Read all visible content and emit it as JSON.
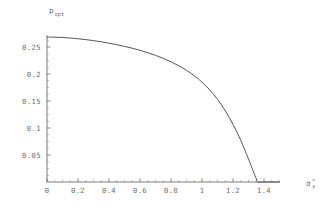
{
  "chart_data": {
    "type": "line",
    "title": "",
    "subtitle": "",
    "ylabel": "p_opt",
    "ylabel_base": "p",
    "ylabel_sub": "opt",
    "xlabel": "sigma*_f",
    "xlabel_base": "σ",
    "xlabel_sup": "*",
    "xlabel_sub": "f",
    "xlim": [
      0,
      1.5
    ],
    "ylim": [
      0,
      0.285
    ],
    "grid": false,
    "legend": null,
    "xticks": [
      0,
      0.2,
      0.4,
      0.6,
      0.8,
      1,
      1.2,
      1.4
    ],
    "xticklabels": [
      "0",
      "0.2",
      "0.4",
      "0.6",
      "0.8",
      "1",
      "1.2",
      "1.4"
    ],
    "yticks": [
      0.05,
      0.1,
      0.15,
      0.2,
      0.25
    ],
    "yticklabels": [
      "0.05",
      "0.1",
      "0.15",
      "0.2",
      "0.25"
    ],
    "x_minor_step": 0.05,
    "y_minor_step": 0.0125,
    "series": [
      {
        "name": "p_opt",
        "color": "#55555a",
        "x": [
          0.0,
          0.05,
          0.1,
          0.15,
          0.2,
          0.25,
          0.3,
          0.35,
          0.4,
          0.45,
          0.5,
          0.55,
          0.6,
          0.65,
          0.7,
          0.75,
          0.8,
          0.85,
          0.9,
          0.95,
          1.0,
          1.05,
          1.1,
          1.15,
          1.2,
          1.25,
          1.3,
          1.33,
          1.35,
          1.36,
          1.4,
          1.45,
          1.5
        ],
        "y": [
          0.2685,
          0.2682,
          0.2676,
          0.2666,
          0.2653,
          0.2637,
          0.2618,
          0.2596,
          0.2571,
          0.2543,
          0.2512,
          0.2477,
          0.2438,
          0.2394,
          0.2345,
          0.2289,
          0.2226,
          0.2153,
          0.2068,
          0.1968,
          0.1849,
          0.1705,
          0.1531,
          0.132,
          0.1068,
          0.0772,
          0.0425,
          0.0205,
          0.006,
          0.0,
          0.0,
          0.0,
          0.0
        ]
      }
    ],
    "annotations": []
  },
  "geometry": {
    "plot_origin_x_px": 47,
    "plot_origin_y_px": 182,
    "px_per_x_unit": 155,
    "px_per_y_unit": 540
  }
}
